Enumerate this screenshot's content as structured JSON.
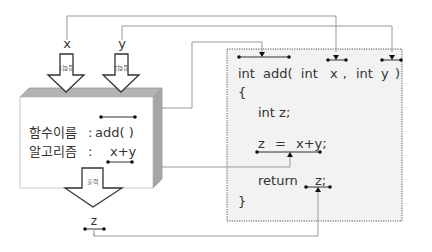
{
  "diagram": {
    "title": "",
    "inputs": [
      {
        "name": "x",
        "arrow_label": "입력1"
      },
      {
        "name": "y",
        "arrow_label": "입력2"
      }
    ],
    "output": {
      "name": "z",
      "arrow_label": "출력"
    },
    "function_box": {
      "name_label": "함수이름",
      "name_value": "add( )",
      "algorithm_label": "알고리즘",
      "algorithm_value": "x+y",
      "separator": ":"
    },
    "code": {
      "lines": [
        {
          "kw": "int",
          "text": "add(",
          "p1kw": "int",
          "p1": "x",
          "comma": ",",
          "p2kw": "int",
          "p2": "y",
          "close": ")"
        },
        {
          "text": "{"
        },
        {
          "text": "int  z;"
        },
        {
          "lhs": "z",
          "eq": "=",
          "rhs": "x+y;"
        },
        {
          "kw": "return",
          "val": "z;"
        },
        {
          "text": "}"
        }
      ]
    },
    "colors": {
      "box_fill": "#ffffff",
      "box_top": "#b3b3b3",
      "box_side": "#a6a6a6",
      "code_panel_fill": "#f2f2f2",
      "code_panel_border": "#555555",
      "wire": "#999999",
      "text": "#333333"
    },
    "connections": [
      {
        "from": "x",
        "to": "code.param_x"
      },
      {
        "from": "y",
        "to": "code.param_y"
      },
      {
        "from": "function_box.name_value",
        "to": "code.function_name"
      },
      {
        "from": "function_box.algorithm_value",
        "to": "code.assignment"
      },
      {
        "from": "z",
        "to": "code.return_value"
      }
    ]
  }
}
